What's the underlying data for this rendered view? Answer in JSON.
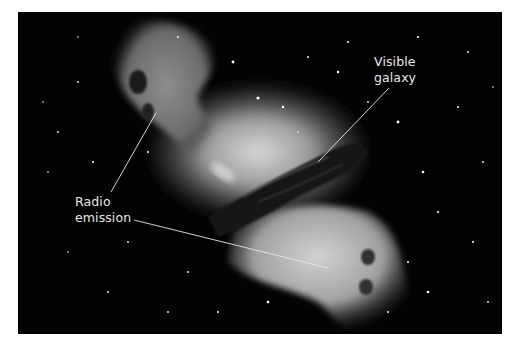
{
  "figure": {
    "background_color": "#030303",
    "labels": [
      {
        "id": "radio",
        "lines": [
          "Radio",
          "emission"
        ]
      },
      {
        "id": "visible",
        "lines": [
          "Visible",
          "galaxy"
        ]
      }
    ]
  }
}
